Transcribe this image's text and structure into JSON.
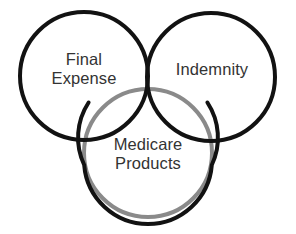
{
  "diagram": {
    "type": "venn-trefoil",
    "title": "",
    "background_color": "#ffffff",
    "stroke_color": "#121212",
    "secondary_stroke_color": "#8a8a8a",
    "text_color": "#333333",
    "stroke_width": 4,
    "circles": [
      {
        "name": "final-expense",
        "cx": 84,
        "cy": 76,
        "r": 64,
        "stroke": "#121212",
        "label_lines": [
          "Final",
          "Expense"
        ]
      },
      {
        "name": "indemnity",
        "cx": 211,
        "cy": 77,
        "r": 64,
        "stroke": "#121212",
        "label_lines": [
          "Indemnity"
        ]
      },
      {
        "name": "medicare-products",
        "cx": 148,
        "cy": 153,
        "r": 64,
        "stroke": "#121212",
        "overlap_arc_stroke": "#8a8a8a",
        "label_lines": [
          "Medicare",
          "Products"
        ]
      }
    ],
    "labels": {
      "final_expense": {
        "line1": "Final",
        "line2": "Expense"
      },
      "indemnity": {
        "line1": "Indemnity"
      },
      "medicare_products": {
        "line1": "Medicare",
        "line2": "Products"
      }
    }
  }
}
